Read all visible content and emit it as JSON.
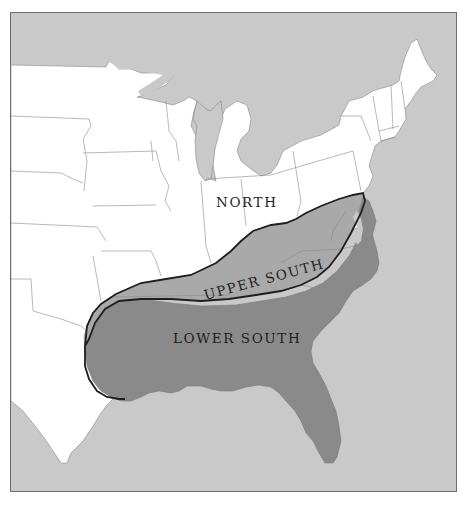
{
  "map": {
    "type": "thematic regional map",
    "area": "Eastern United States",
    "colors": {
      "water": "#c9c9c9",
      "land_north": "#ffffff",
      "upper_south_fill": "#a9a9a9",
      "lower_south_fill": "#8a8a8a",
      "state_borders": "#7a7a7a",
      "region_outline": "#1f1f1f",
      "frame_border": "#6e6e6e"
    },
    "regions": [
      {
        "id": "north",
        "label": "NORTH"
      },
      {
        "id": "upper-south",
        "label": "UPPER SOUTH"
      },
      {
        "id": "lower-south",
        "label": "LOWER SOUTH"
      }
    ]
  }
}
